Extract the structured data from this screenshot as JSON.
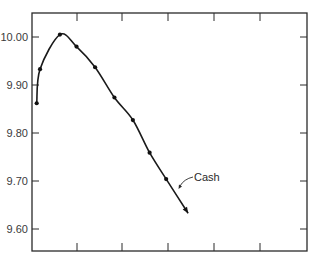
{
  "chart_data": {
    "type": "line",
    "title": "",
    "xlabel": "",
    "ylabel": "",
    "ylim": [
      9.555,
      10.055
    ],
    "y_ticks": [
      "10.00",
      "9.90",
      "9.80",
      "9.70",
      "9.60"
    ],
    "x_ticks": [
      "",
      "",
      "",
      "",
      ""
    ],
    "grid": false,
    "legend": null,
    "series": [
      {
        "name": "Cash",
        "markers": true,
        "points": [
          {
            "x": 0.0,
            "y": 9.862
          },
          {
            "x": 0.18,
            "y": 9.933
          },
          {
            "x": 1.25,
            "y": 10.005
          },
          {
            "x": 2.14,
            "y": 9.98
          },
          {
            "x": 3.14,
            "y": 9.937
          },
          {
            "x": 4.18,
            "y": 9.874
          },
          {
            "x": 5.17,
            "y": 9.827
          },
          {
            "x": 6.07,
            "y": 9.759
          },
          {
            "x": 6.96,
            "y": 9.704
          }
        ],
        "curve_end": {
          "x": 8.14,
          "y": 9.633
        }
      }
    ],
    "annotations": [
      {
        "text": "Cash",
        "points_to": "series Cash line near y≈9.68"
      }
    ]
  }
}
